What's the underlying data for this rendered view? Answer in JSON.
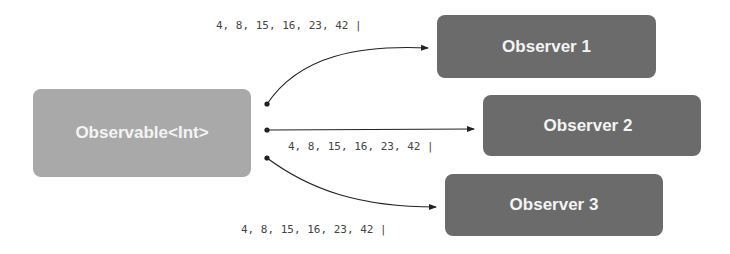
{
  "source": {
    "label": "Observable<Int>",
    "color": "#a9a9a9"
  },
  "observers": [
    {
      "label": "Observer 1",
      "color": "#6b6b6b"
    },
    {
      "label": "Observer 2",
      "color": "#6b6b6b"
    },
    {
      "label": "Observer 3",
      "color": "#6b6b6b"
    }
  ],
  "streams": [
    {
      "label": "4, 8, 15, 16, 23, 42 |",
      "target": "Observer 1"
    },
    {
      "label": "4, 8, 15, 16, 23, 42 |",
      "target": "Observer 2"
    },
    {
      "label": "4, 8, 15, 16, 23, 42 |",
      "target": "Observer 3"
    }
  ]
}
